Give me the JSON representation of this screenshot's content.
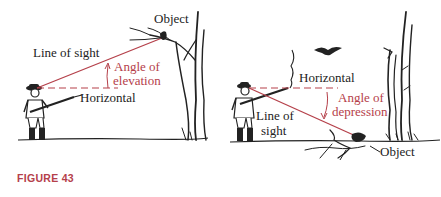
{
  "caption": "FIGURE 43",
  "colors": {
    "accent_red": "#b5404a",
    "ink": "#222222"
  },
  "panels": [
    {
      "name": "elevation",
      "labels": {
        "object": "Object",
        "line_of_sight": "Line of sight",
        "angle_line1": "Angle of",
        "angle_line2": "elevation",
        "horizontal": "Horizontal"
      }
    },
    {
      "name": "depression",
      "labels": {
        "horizontal": "Horizontal",
        "angle_line1": "Angle of",
        "angle_line2": "depression",
        "line_of_sight_line1": "Line of",
        "line_of_sight_line2": "sight",
        "object": "Object"
      }
    }
  ]
}
